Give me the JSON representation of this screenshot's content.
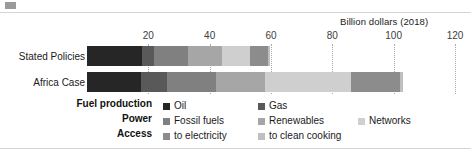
{
  "chart_data": {
    "type": "bar",
    "orientation": "horizontal",
    "stacked": true,
    "title": "",
    "axis_title": "Billion dollars (2018)",
    "xlabel": "Billion dollars (2018)",
    "ylabel": "",
    "xlim": [
      0,
      120
    ],
    "ticks": [
      20,
      40,
      60,
      80,
      100,
      120
    ],
    "tick_labels": [
      "20",
      "40",
      "60",
      "80",
      "100",
      "120"
    ],
    "grid": "vertical-dotted",
    "legend_position": "bottom",
    "categories": [
      "Stated Policies",
      "Africa Case"
    ],
    "series": [
      {
        "name": "Oil",
        "group": "Fuel production",
        "color": "#262626",
        "values": [
          18,
          17.5
        ]
      },
      {
        "name": "Gas",
        "group": "Fuel production",
        "color": "#595959",
        "values": [
          4,
          8.5
        ]
      },
      {
        "name": "Fossil fuels",
        "group": "Power",
        "color": "#808080",
        "values": [
          11,
          16
        ]
      },
      {
        "name": "Renewables",
        "group": "Power",
        "color": "#a6a6a6",
        "values": [
          11,
          16
        ]
      },
      {
        "name": "Networks",
        "group": "Power",
        "color": "#cfcfcf",
        "values": [
          9,
          28
        ]
      },
      {
        "name": "to electricity",
        "group": "Access",
        "color": "#8c8c8c",
        "values": [
          6,
          16
        ]
      },
      {
        "name": "to clean cooking",
        "group": "Access",
        "color": "#bfbfbf",
        "values": [
          0.6,
          1
        ]
      }
    ],
    "totals": [
      60,
      103
    ]
  },
  "legend": {
    "groups": [
      {
        "label": "Fuel production",
        "items": [
          {
            "label": "Oil",
            "color": "#262626"
          },
          {
            "label": "Gas",
            "color": "#595959"
          }
        ]
      },
      {
        "label": "Power",
        "items": [
          {
            "label": "Fossil fuels",
            "color": "#808080"
          },
          {
            "label": "Renewables",
            "color": "#a6a6a6"
          },
          {
            "label": "Networks",
            "color": "#cfcfcf"
          }
        ]
      },
      {
        "label": "Access",
        "items": [
          {
            "label": "to electricity",
            "color": "#8c8c8c"
          },
          {
            "label": "to clean cooking",
            "color": "#bfbfbf"
          }
        ]
      }
    ]
  },
  "axis": {
    "title": "Billion dollars (2018)",
    "tick_labels": [
      "20",
      "40",
      "60",
      "80",
      "100",
      "120"
    ]
  },
  "categories": {
    "stated_policies": "Stated Policies",
    "africa_case": "Africa Case"
  }
}
